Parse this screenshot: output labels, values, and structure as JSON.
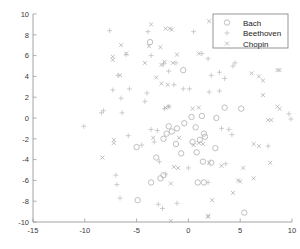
{
  "chart_data": {
    "type": "scatter",
    "title": "",
    "xlabel": "",
    "ylabel": "",
    "xlim": [
      -15,
      10
    ],
    "ylim": [
      -10,
      10
    ],
    "xticks": [
      -15,
      -10,
      -5,
      0,
      5,
      10
    ],
    "yticks": [
      -10,
      -8,
      -6,
      -4,
      -2,
      0,
      2,
      4,
      6,
      8,
      10
    ],
    "xtick_labels": [
      "-15",
      "-10",
      "-5",
      "0",
      "5",
      "10"
    ],
    "ytick_labels": [
      "-10",
      "-8",
      "-6",
      "-4",
      "-2",
      "0",
      "2",
      "4",
      "6",
      "8",
      "10"
    ],
    "grid": false,
    "legend_position": "upper right",
    "series": [
      {
        "name": "Bach",
        "marker": "circle",
        "color": "#b4b4b4",
        "points": [
          [
            -3.7,
            7.3
          ],
          [
            -0.5,
            4.6
          ],
          [
            3.5,
            1.0
          ],
          [
            5.1,
            0.9
          ],
          [
            0.3,
            0.1
          ],
          [
            1.3,
            0.2
          ],
          [
            2.7,
            0.0
          ],
          [
            -1.9,
            -0.8
          ],
          [
            -0.4,
            -0.5
          ],
          [
            -1.1,
            -1.0
          ],
          [
            -1.6,
            -1.3
          ],
          [
            -2.1,
            -1.5
          ],
          [
            0.7,
            -0.9
          ],
          [
            1.5,
            -1.5
          ],
          [
            1.6,
            -1.8
          ],
          [
            -2.4,
            -2.0
          ],
          [
            -5.0,
            -2.8
          ],
          [
            -1.2,
            -2.5
          ],
          [
            0.4,
            -2.3
          ],
          [
            1.1,
            -2.1
          ],
          [
            2.6,
            -2.9
          ],
          [
            -3.1,
            -3.8
          ],
          [
            -0.7,
            -3.4
          ],
          [
            0.8,
            -3.3
          ],
          [
            1.4,
            -4.2
          ],
          [
            2.2,
            -4.3
          ],
          [
            -2.4,
            -5.5
          ],
          [
            -3.6,
            -6.2
          ],
          [
            -2.7,
            -5.8
          ],
          [
            0.9,
            -6.2
          ],
          [
            1.5,
            -6.2
          ],
          [
            -4.9,
            -7.9
          ],
          [
            5.4,
            -9.1
          ]
        ]
      },
      {
        "name": "Beethoven",
        "marker": "plus",
        "color": "#c2c2c2",
        "points": [
          [
            -7.6,
            8.4
          ],
          [
            -3.9,
            8.3
          ],
          [
            0.5,
            8.3
          ],
          [
            -6.0,
            6.1
          ],
          [
            -3.6,
            6.0
          ],
          [
            1.3,
            6.2
          ],
          [
            1.9,
            5.7
          ],
          [
            4.0,
            6.9
          ],
          [
            4.5,
            5.3
          ],
          [
            4.3,
            5.0
          ],
          [
            -2.4,
            5.2
          ],
          [
            -1.2,
            5.3
          ],
          [
            -6.8,
            4.1
          ],
          [
            -1.9,
            4.5
          ],
          [
            3.0,
            4.4
          ],
          [
            2.2,
            4.1
          ],
          [
            3.5,
            3.8
          ],
          [
            -7.3,
            2.7
          ],
          [
            -5.7,
            2.8
          ],
          [
            -4.0,
            2.4
          ],
          [
            -1.4,
            3.2
          ],
          [
            -0.5,
            2.8
          ],
          [
            0.1,
            2.8
          ],
          [
            2.0,
            2.5
          ],
          [
            3.0,
            2.6
          ],
          [
            -6.5,
            1.9
          ],
          [
            -4.2,
            1.6
          ],
          [
            -8.4,
            0.5
          ],
          [
            -8.2,
            0.7
          ],
          [
            -6.4,
            0.5
          ],
          [
            -2.3,
            0.9
          ],
          [
            -1.9,
            1.1
          ],
          [
            9.7,
            0.4
          ],
          [
            9.9,
            -0.1
          ],
          [
            -10.1,
            -0.8
          ],
          [
            -3.6,
            -1.1
          ],
          [
            -3.0,
            -1.2
          ],
          [
            -5.8,
            -1.7
          ],
          [
            -4.5,
            -2.6
          ],
          [
            -3.3,
            -2.3
          ],
          [
            3.2,
            -1.0
          ],
          [
            3.9,
            -1.1
          ],
          [
            4.2,
            -1.6
          ],
          [
            7.7,
            -2.7
          ],
          [
            -2.8,
            -4.2
          ],
          [
            0.0,
            -4.8
          ],
          [
            3.6,
            -4.4
          ],
          [
            -2.2,
            -5.4
          ],
          [
            -7.0,
            -5.5
          ],
          [
            -6.9,
            -6.4
          ],
          [
            1.9,
            -6.2
          ],
          [
            -6.6,
            -7.7
          ],
          [
            -2.9,
            -8.3
          ],
          [
            -2.5,
            -8.7
          ],
          [
            -1.1,
            -8.2
          ]
        ]
      },
      {
        "name": "Chopin",
        "marker": "cross",
        "color": "#b0b0b0",
        "points": [
          [
            2.0,
            9.3
          ],
          [
            -3.6,
            9.0
          ],
          [
            -2.2,
            8.6
          ],
          [
            -1.8,
            8.6
          ],
          [
            -1.6,
            8.5
          ],
          [
            -6.5,
            7.0
          ],
          [
            -6.0,
            6.2
          ],
          [
            -3.8,
            6.9
          ],
          [
            -2.7,
            6.8
          ],
          [
            -1.1,
            6.1
          ],
          [
            1.0,
            6.2
          ],
          [
            -7.3,
            5.9
          ],
          [
            -7.3,
            5.6
          ],
          [
            -4.2,
            5.3
          ],
          [
            -2.6,
            5.1
          ],
          [
            -2.3,
            5.4
          ],
          [
            -1.5,
            5.3
          ],
          [
            8.6,
            4.6
          ],
          [
            8.8,
            4.6
          ],
          [
            6.1,
            4.3
          ],
          [
            6.8,
            4.0
          ],
          [
            7.2,
            3.6
          ],
          [
            -6.6,
            4.1
          ],
          [
            -3.1,
            3.9
          ],
          [
            -2.6,
            3.3
          ],
          [
            -2.0,
            3.2
          ],
          [
            7.2,
            2.2
          ],
          [
            -2.2,
            1.0
          ],
          [
            -1.9,
            1.1
          ],
          [
            0.4,
            0.9
          ],
          [
            1.0,
            1.0
          ],
          [
            8.6,
            1.1
          ],
          [
            8.8,
            0.9
          ],
          [
            7.7,
            -0.2
          ],
          [
            8.0,
            -0.2
          ],
          [
            -7.2,
            -2.1
          ],
          [
            -7.2,
            -2.4
          ],
          [
            -3.4,
            -1.9
          ],
          [
            -0.9,
            -1.9
          ],
          [
            0.5,
            -2.6
          ],
          [
            1.0,
            -2.4
          ],
          [
            1.4,
            -2.5
          ],
          [
            6.3,
            -2.5
          ],
          [
            6.8,
            -2.7
          ],
          [
            -8.3,
            -3.8
          ],
          [
            7.9,
            -4.3
          ],
          [
            -1.4,
            -4.7
          ],
          [
            -1.0,
            -4.8
          ],
          [
            2.0,
            -4.3
          ],
          [
            3.2,
            -4.6
          ],
          [
            5.3,
            -4.8
          ],
          [
            -1.7,
            -6.3
          ],
          [
            4.8,
            -6.0
          ],
          [
            5.0,
            -6.1
          ],
          [
            6.3,
            -5.8
          ],
          [
            4.3,
            -7.2
          ],
          [
            2.3,
            -7.9
          ],
          [
            1.9,
            -9.5
          ],
          [
            1.9,
            -9.4
          ],
          [
            -1.7,
            -9.9
          ]
        ]
      }
    ]
  },
  "legend": {
    "entries": [
      {
        "label": "Bach",
        "marker": "circle"
      },
      {
        "label": "Beethoven",
        "marker": "plus"
      },
      {
        "label": "Chopin",
        "marker": "cross"
      }
    ]
  }
}
